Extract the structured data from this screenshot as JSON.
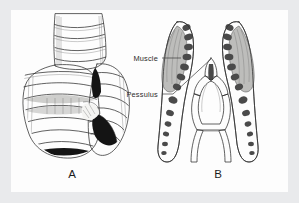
{
  "figure": {
    "kind": "scientific-illustration",
    "frame_color": "#e9eaec",
    "plate_background": "#fdfdfd",
    "ink_color": "#2e2e2e",
    "panels": [
      {
        "id": "A",
        "label": "A",
        "description": "External view of the syrinx at the tracheobronchial junction, showing stacked tracheal and bronchial cartilage rings with dark tympaniform membrane wedges"
      },
      {
        "id": "B",
        "label": "B",
        "description": "Internal components: left and right bronchial half-rings bearing syringeal muscle, with the isolated pessulus shown between them"
      }
    ],
    "annotations": [
      {
        "id": "muscle",
        "text": "Muscle",
        "target": "cross-hatched syringeal muscle on left bronchus"
      },
      {
        "id": "pessulus",
        "text": "Pessulus",
        "target": "median cartilaginous bar at the tracheal bifurcation"
      }
    ]
  }
}
